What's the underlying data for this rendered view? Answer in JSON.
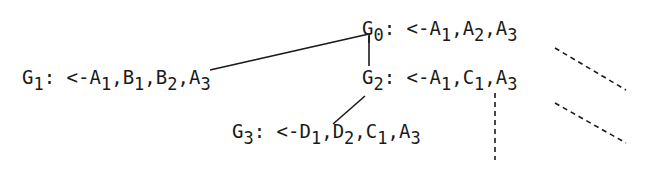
{
  "nodes": [
    {
      "id": "G0",
      "label": "G",
      "sub": "0",
      "clause": [
        [
          "A",
          "1"
        ],
        [
          "A",
          "2"
        ],
        [
          "A",
          "3"
        ]
      ]
    },
    {
      "id": "G1",
      "label": "G",
      "sub": "1",
      "clause": [
        [
          "A",
          "1"
        ],
        [
          "B",
          "1"
        ],
        [
          "B",
          "2"
        ],
        [
          "A",
          "3"
        ]
      ]
    },
    {
      "id": "G2",
      "label": "G",
      "sub": "2",
      "clause": [
        [
          "A",
          "1"
        ],
        [
          "C",
          "1"
        ],
        [
          "A",
          "3"
        ]
      ]
    },
    {
      "id": "G3",
      "label": "G",
      "sub": "3",
      "clause": [
        [
          "D",
          "1"
        ],
        [
          "D",
          "2"
        ],
        [
          "C",
          "1"
        ],
        [
          "A",
          "3"
        ]
      ]
    }
  ],
  "separator": ": <-",
  "comma": ",",
  "edges": [
    {
      "from": "G0",
      "to": "G1",
      "style": "solid"
    },
    {
      "from": "G0",
      "to": "G2",
      "style": "solid"
    },
    {
      "from": "G2",
      "to": "G3",
      "style": "solid"
    },
    {
      "from": "G0",
      "to": "continuation",
      "style": "dashed"
    },
    {
      "from": "G2",
      "to": "continuation",
      "style": "dashed"
    },
    {
      "from": "G2",
      "to": "continuation-below",
      "style": "dashed"
    }
  ]
}
